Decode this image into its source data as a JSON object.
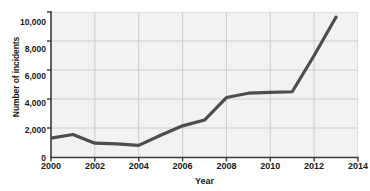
{
  "chart_data": {
    "type": "line",
    "title": "",
    "xlabel": "Year",
    "ylabel": "Number of incidents",
    "xlim": [
      2000,
      2014
    ],
    "ylim": [
      0,
      10000
    ],
    "grid": true,
    "legend": null,
    "xticks": [
      "2000",
      "2002",
      "2004",
      "2006",
      "2008",
      "2010",
      "2012",
      "2014"
    ],
    "xtick_values": [
      2000,
      2002,
      2004,
      2006,
      2008,
      2010,
      2012,
      2014
    ],
    "yticks": [
      "0",
      "2,000",
      "4,000",
      "6,000",
      "8,000",
      "10,000"
    ],
    "ytick_values": [
      0,
      2000,
      4000,
      6000,
      8000,
      10000
    ],
    "x": [
      2000,
      2001,
      2002,
      2003,
      2004,
      2005,
      2006,
      2007,
      2008,
      2009,
      2010,
      2011,
      2012,
      2013
    ],
    "series": [
      {
        "name": "Number of incidents",
        "color": "#4d4d4d",
        "values": [
          1300,
          1550,
          950,
          900,
          800,
          1500,
          2150,
          2550,
          4100,
          4400,
          4450,
          4500,
          7000,
          9650
        ]
      }
    ],
    "plot_background": "#f2f2f2",
    "grid_color": "#c8c8c8",
    "axis_color": "#3a3a3a"
  }
}
